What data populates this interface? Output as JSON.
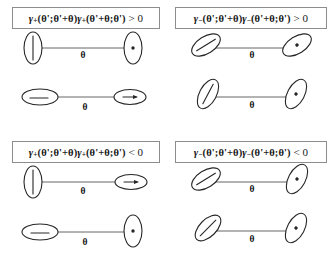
{
  "figure": {
    "angle_symbol": "θ"
  },
  "panels": [
    {
      "id": "top-left",
      "name": "panel-gamma-plus-positive",
      "label": {
        "gamma": "γ",
        "subscript": "+",
        "arg1": "(θ';θ'+θ)",
        "arg2": "(θ'+θ;θ')",
        "relation": "> 0",
        "full": "γ₊(θ';θ'+θ)γ₊(θ'+θ;θ') > 0"
      },
      "rows": [
        {
          "angle_label": "θ",
          "left": {
            "tilt_deg": 0,
            "marker": "line",
            "orientation": "vertical"
          },
          "right": {
            "tilt_deg": 0,
            "marker": "dot",
            "orientation": "vertical"
          }
        },
        {
          "angle_label": "θ",
          "left": {
            "tilt_deg": 90,
            "marker": "line",
            "orientation": "horizontal"
          },
          "right": {
            "tilt_deg": 90,
            "marker": "arrow",
            "orientation": "horizontal"
          }
        }
      ]
    },
    {
      "id": "top-right",
      "name": "panel-gamma-minus-positive",
      "label": {
        "gamma": "γ",
        "subscript": "−",
        "arg1": "(θ';θ'+θ)",
        "arg2": "(θ'+θ;θ')",
        "relation": "> 0",
        "full": "γ₋(θ';θ'+θ)γ₋(θ'+θ;θ') > 0"
      },
      "rows": [
        {
          "angle_label": "θ",
          "left": {
            "tilt_deg": 58,
            "marker": "line",
            "orientation": "tilted"
          },
          "right": {
            "tilt_deg": 58,
            "marker": "dot",
            "orientation": "tilted"
          }
        },
        {
          "angle_label": "θ",
          "left": {
            "tilt_deg": 28,
            "marker": "line",
            "orientation": "tilted"
          },
          "right": {
            "tilt_deg": 28,
            "marker": "dot",
            "orientation": "tilted"
          }
        }
      ]
    },
    {
      "id": "bottom-left",
      "name": "panel-gamma-plus-negative",
      "label": {
        "gamma": "γ",
        "subscript": "+",
        "arg1": "(θ';θ'+θ)",
        "arg2": "(θ'+θ;θ')",
        "relation": "< 0",
        "full": "γ₊(θ';θ'+θ)γ₊(θ'+θ;θ') < 0"
      },
      "rows": [
        {
          "angle_label": "θ",
          "left": {
            "tilt_deg": 0,
            "marker": "line",
            "orientation": "vertical"
          },
          "right": {
            "tilt_deg": 90,
            "marker": "arrow",
            "orientation": "horizontal"
          }
        },
        {
          "angle_label": "θ",
          "left": {
            "tilt_deg": 90,
            "marker": "line",
            "orientation": "horizontal"
          },
          "right": {
            "tilt_deg": 0,
            "marker": "dot",
            "orientation": "vertical"
          }
        }
      ]
    },
    {
      "id": "bottom-right",
      "name": "panel-gamma-minus-negative",
      "label": {
        "gamma": "γ",
        "subscript": "−",
        "arg1": "(θ';θ'+θ)",
        "arg2": "(θ'+θ;θ')",
        "relation": "< 0",
        "full": "γ₋(θ';θ'+θ)γ₋(θ'+θ;θ') < 0"
      },
      "rows": [
        {
          "angle_label": "θ",
          "left": {
            "tilt_deg": 58,
            "marker": "line",
            "orientation": "tilted"
          },
          "right": {
            "tilt_deg": 28,
            "marker": "dot",
            "orientation": "tilted"
          }
        },
        {
          "angle_label": "θ",
          "left": {
            "tilt_deg": 45,
            "marker": "line",
            "orientation": "tilted"
          },
          "right": {
            "tilt_deg": 28,
            "marker": "dot",
            "orientation": "tilted"
          }
        }
      ]
    }
  ],
  "colors": {
    "stroke": "#262626",
    "bond": "#555555",
    "box_border": "#8d8d8d",
    "background": "#ffffff"
  }
}
